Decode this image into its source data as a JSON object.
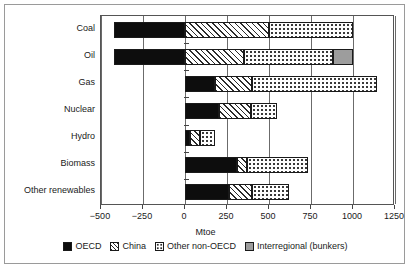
{
  "chart_data": {
    "type": "bar",
    "orientation": "horizontal",
    "stacked": true,
    "title": "",
    "xlabel": "Mtoe",
    "ylabel": "",
    "xlim": [
      -500,
      1250
    ],
    "xticks": [
      -500,
      -250,
      0,
      250,
      500,
      750,
      1000,
      1250
    ],
    "xticklabels": [
      "−500",
      "−250",
      "0",
      "250",
      "500",
      "750",
      "1000",
      "1250"
    ],
    "grid": true,
    "legend_position": "bottom",
    "categories": [
      "Coal",
      "Oil",
      "Gas",
      "Nuclear",
      "Hydro",
      "Biomass",
      "Other renewables"
    ],
    "series": [
      {
        "name": "OECD",
        "color": "#0d0d0d",
        "pattern": "solid-black",
        "values": [
          -420,
          -425,
          180,
          200,
          30,
          310,
          260
        ]
      },
      {
        "name": "China",
        "color": "#2b2b2b",
        "pattern": "diagonal-hatch",
        "values": [
          500,
          350,
          220,
          190,
          60,
          60,
          140
        ]
      },
      {
        "name": "Other non-OECD",
        "color": "#2b2b2b",
        "pattern": "dots",
        "values": [
          500,
          530,
          740,
          160,
          90,
          360,
          220
        ]
      },
      {
        "name": "Interregional (bunkers)",
        "color": "#9d9d9d",
        "pattern": "solid-gray",
        "values": [
          0,
          120,
          0,
          0,
          0,
          0,
          0
        ]
      }
    ],
    "positive_totals": [
      1000,
      1000,
      1140,
      550,
      180,
      730,
      620
    ],
    "negative_totals": [
      -420,
      -425,
      0,
      0,
      0,
      0,
      0
    ]
  },
  "legend": {
    "items": [
      {
        "label": "OECD",
        "swatch": "oecd"
      },
      {
        "label": "China",
        "swatch": "china"
      },
      {
        "label": "Other non-OECD",
        "swatch": "other"
      },
      {
        "label": "Interregional (bunkers)",
        "swatch": "bunkers"
      }
    ]
  }
}
